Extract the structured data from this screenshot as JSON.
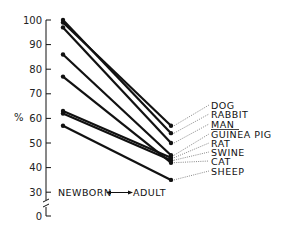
{
  "chart_data": {
    "type": "line",
    "title": "",
    "xlabel": "NEWBORN ↔ ADULT",
    "ylabel": "%",
    "categories": [
      "NEWBORN",
      "ADULT"
    ],
    "yticks": [
      0,
      30,
      40,
      50,
      60,
      70,
      80,
      90,
      100
    ],
    "ylim": [
      0,
      100
    ],
    "axis_break": true,
    "grid": false,
    "series": [
      {
        "name": "DOG",
        "values": [
          99,
          57
        ]
      },
      {
        "name": "RABBIT",
        "values": [
          100,
          54
        ]
      },
      {
        "name": "MAN",
        "values": [
          97,
          50
        ]
      },
      {
        "name": "GUINEA PIG",
        "values": [
          86,
          45
        ]
      },
      {
        "name": "RAT",
        "values": [
          63,
          44
        ]
      },
      {
        "name": "SWINE",
        "values": [
          62,
          43
        ]
      },
      {
        "name": "CAT",
        "values": [
          77,
          42
        ]
      },
      {
        "name": "SHEEP",
        "values": [
          57,
          35
        ]
      }
    ],
    "legend_position": "right, labels linked by dotted leaders"
  },
  "axis": {
    "y_label": "%",
    "ticks": [
      "100",
      "90",
      "80",
      "70",
      "60",
      "50",
      "40",
      "30",
      "0"
    ],
    "x_left": "NEWBORN",
    "x_right": "ADULT"
  },
  "labels": [
    "DOG",
    "RABBIT",
    "MAN",
    "GUINEA PIG",
    "RAT",
    "SWINE",
    "CAT",
    "SHEEP"
  ]
}
